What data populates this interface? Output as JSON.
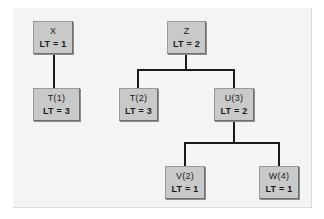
{
  "figure": {
    "kind": "tree-diagram",
    "background_color": "#ffffff",
    "panel_color": "#f4f4f4",
    "node_fill_color": "#c9c9c9",
    "node_border_color": "#6e6e6e",
    "edge_color": "#1a1a1a"
  },
  "nodes": [
    {
      "id": "x",
      "name": "X",
      "lt": "LT = 1",
      "x": 33,
      "y": 21,
      "w": 40,
      "h": 33
    },
    {
      "id": "t1",
      "name": "T(1)",
      "lt": "LT = 3",
      "x": 33,
      "y": 88,
      "w": 47,
      "h": 33
    },
    {
      "id": "z",
      "name": "Z",
      "lt": "LT = 2",
      "x": 167,
      "y": 21,
      "w": 39,
      "h": 33
    },
    {
      "id": "t2",
      "name": "T(2)",
      "lt": "LT = 3",
      "x": 119,
      "y": 88,
      "w": 39,
      "h": 33
    },
    {
      "id": "u3",
      "name": "U(3)",
      "lt": "LT = 2",
      "x": 214,
      "y": 88,
      "w": 40,
      "h": 33
    },
    {
      "id": "v2",
      "name": "V(2)",
      "lt": "LT = 1",
      "x": 165,
      "y": 166,
      "w": 40,
      "h": 33
    },
    {
      "id": "w4",
      "name": "W(4)",
      "lt": "LT = 1",
      "x": 259,
      "y": 166,
      "w": 40,
      "h": 33
    }
  ],
  "edges": [
    {
      "id": "x-t1",
      "from": "x",
      "to": "t1"
    },
    {
      "id": "z-t2",
      "from": "z",
      "to": "t2"
    },
    {
      "id": "z-u3",
      "from": "z",
      "to": "u3"
    },
    {
      "id": "u3-v2",
      "from": "u3",
      "to": "v2"
    },
    {
      "id": "u3-w4",
      "from": "u3",
      "to": "w4"
    }
  ]
}
